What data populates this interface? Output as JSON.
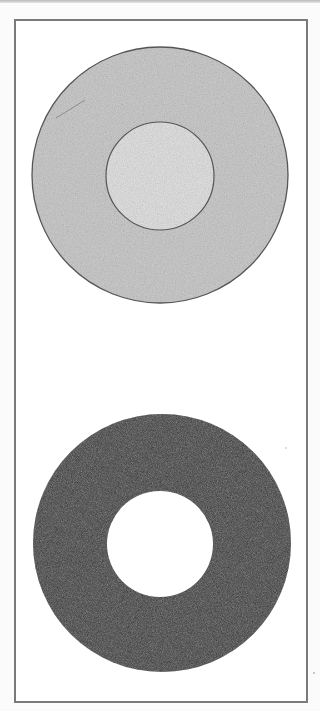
{
  "figure": {
    "top_disk": {
      "description": "pencil-shaded gray disk with outlined inner circle",
      "outer_fill": "#c9c9c9",
      "inner_fill": "#e2e2e2",
      "outline": "#555555",
      "center": [
        160,
        175
      ],
      "outer_radius": 128,
      "inner_radius": 54
    },
    "bottom_ring": {
      "description": "solid dark ring (annulus) with white hole",
      "fill": "#2e2e2e",
      "hole_fill": "#ffffff",
      "center": [
        162,
        543
      ],
      "outer_radius": 129,
      "hole_radius": 53
    },
    "frame_color": "#7a7a7a"
  }
}
